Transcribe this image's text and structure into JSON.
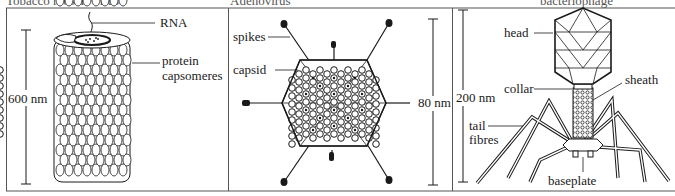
{
  "captions": {
    "tmv": "Tobacco mosaic virus",
    "adenovirus": "Adenovirus",
    "phage": "bacteriophage"
  },
  "panels": [
    {
      "name": "tobacco-mosaic-virus",
      "labels": {
        "rna": "RNA",
        "protein": "protein",
        "capsomeres": "capsomeres",
        "scale": "600 nm"
      }
    },
    {
      "name": "adenovirus",
      "labels": {
        "spikes": "spikes",
        "capsid": "capsid",
        "scale": "80 nm"
      }
    },
    {
      "name": "bacteriophage",
      "labels": {
        "head": "head",
        "collar": "collar",
        "sheath": "sheath",
        "scale": "200 nm",
        "tail": "tail",
        "fibres": "fibres",
        "baseplate": "baseplate"
      }
    }
  ],
  "colors": {
    "ink": "#1a1a1a",
    "frame": "#555555",
    "paper": "#ffffff"
  }
}
